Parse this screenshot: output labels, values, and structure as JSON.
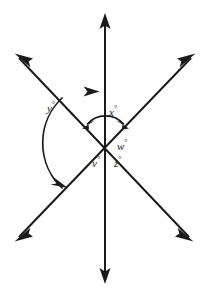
{
  "figure": {
    "type": "geometry-angle-diagram",
    "width": 209,
    "height": 297,
    "background_color": "#ffffff",
    "line_color": "#1a1a1a"
  },
  "vertex": {
    "x": 105,
    "y": 143
  },
  "lines": [
    {
      "name": "vertical-line",
      "x1": 105,
      "y1": 15,
      "x2": 105,
      "y2": 282,
      "arrow_start": true,
      "arrow_end": true
    },
    {
      "name": "ne-sw-line",
      "x1": 194,
      "y1": 55,
      "x2": 16,
      "y2": 240,
      "arrow_start": true,
      "arrow_end": true
    },
    {
      "name": "nw-se-line",
      "x1": 16,
      "y1": 55,
      "x2": 192,
      "y2": 240,
      "arrow_start": true,
      "arrow_end": true
    }
  ],
  "arcs": [
    {
      "name": "arc-y",
      "label_ref": "y",
      "style": "single-headed",
      "radius": 62,
      "start_angle_deg": 133,
      "end_angle_deg": 271
    },
    {
      "name": "arc-x",
      "label_ref": "x",
      "style": "double-headed",
      "radius": 24,
      "start_angle_deg": 133,
      "end_angle_deg": 46
    }
  ],
  "labels": {
    "y": {
      "variable": "y",
      "degree_symbol": "°",
      "text": "y",
      "x": 47,
      "y": 101
    },
    "x": {
      "variable": "x",
      "degree_symbol": "°",
      "text": "x",
      "x": 109,
      "y": 105
    },
    "w": {
      "variable": "w",
      "degree_symbol": "°",
      "text": "w",
      "x": 117,
      "y": 139
    },
    "v": {
      "variable": "v",
      "degree_symbol": "°",
      "text": "v",
      "x": 92,
      "y": 156
    },
    "z": {
      "variable": "z",
      "degree_symbol": "°",
      "text": "z",
      "x": 114,
      "y": 156
    }
  }
}
